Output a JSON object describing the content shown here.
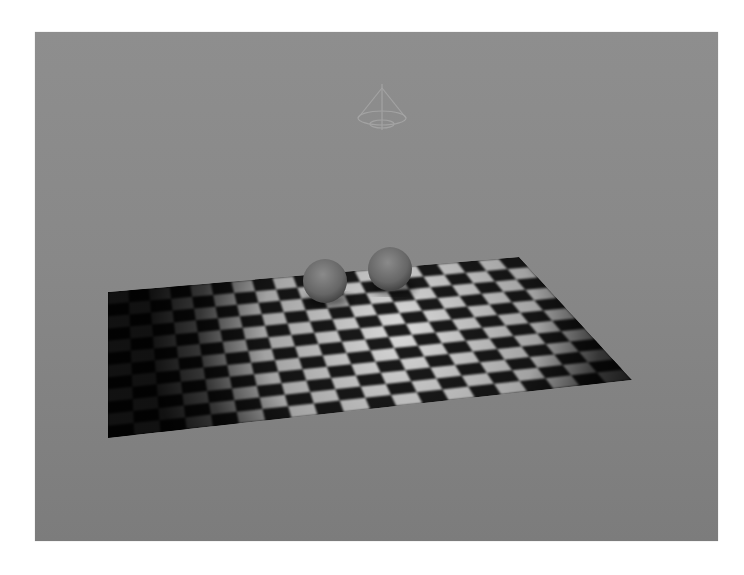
{
  "viewport": {
    "name": "3D render viewport",
    "background_top": "#8e8e8e",
    "background_bottom": "#7c7c7c",
    "rect": [
      35,
      32,
      718,
      541
    ]
  },
  "scene": {
    "light_gizmo": {
      "type": "spot-light",
      "center": [
        382,
        110
      ],
      "color": "#a9a9a9"
    },
    "ground_plane": {
      "corners": {
        "top_left": [
          108,
          292
        ],
        "top_right": [
          519,
          257
        ],
        "bottom_right": [
          632,
          380
        ],
        "bottom_left": [
          108,
          438
        ]
      },
      "checker_cols": 20,
      "checker_rows": 12,
      "light_color": "#d8d8d8",
      "dark_color": "#1a1a1a",
      "spot_center": [
        400,
        330
      ],
      "spot_radius": 250
    },
    "spheres": [
      {
        "name": "sphere-left",
        "cx": 325,
        "cy": 281,
        "r": 22,
        "color": "#6c6c6c"
      },
      {
        "name": "sphere-right",
        "cx": 390,
        "cy": 269,
        "r": 22,
        "color": "#717171"
      }
    ]
  }
}
